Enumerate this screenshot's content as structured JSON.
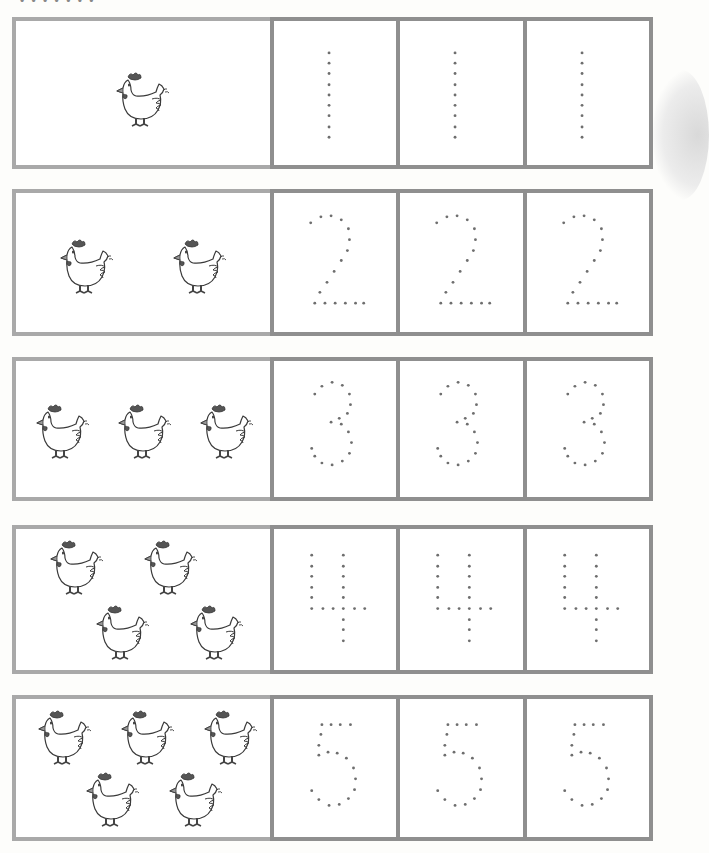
{
  "page": {
    "header_fragment": "• • • • • • •",
    "colors": {
      "pic_border": "#a9a9a9",
      "digit_border": "#8f8f8f",
      "dot": "#6e6e6e",
      "ink": "#3a3a3a",
      "comb": "#555555"
    }
  },
  "rows": [
    {
      "number": 1,
      "label": "one chicken",
      "top": 17,
      "height": 152,
      "chickens": [
        {
          "x": 98,
          "y": 50
        }
      ],
      "digit": "1"
    },
    {
      "number": 2,
      "label": "two chickens",
      "top": 189,
      "height": 147,
      "chickens": [
        {
          "x": 42,
          "y": 45
        },
        {
          "x": 155,
          "y": 45
        }
      ],
      "digit": "2"
    },
    {
      "number": 3,
      "label": "three chickens",
      "top": 357,
      "height": 144,
      "chickens": [
        {
          "x": 18,
          "y": 42
        },
        {
          "x": 100,
          "y": 42
        },
        {
          "x": 182,
          "y": 42
        }
      ],
      "digit": "3"
    },
    {
      "number": 4,
      "label": "four chickens",
      "top": 525,
      "height": 149,
      "chickens": [
        {
          "x": 32,
          "y": 10
        },
        {
          "x": 126,
          "y": 10
        },
        {
          "x": 78,
          "y": 75
        },
        {
          "x": 172,
          "y": 75
        }
      ],
      "digit": "4"
    },
    {
      "number": 5,
      "label": "five chickens",
      "top": 695,
      "height": 146,
      "chickens": [
        {
          "x": 20,
          "y": 10
        },
        {
          "x": 103,
          "y": 10
        },
        {
          "x": 186,
          "y": 10
        },
        {
          "x": 68,
          "y": 72
        },
        {
          "x": 151,
          "y": 72
        }
      ],
      "digit": "5"
    }
  ],
  "digit_dots": {
    "1": [
      [
        54,
        31
      ],
      [
        54,
        41
      ],
      [
        54,
        51
      ],
      [
        54,
        62
      ],
      [
        54,
        72
      ],
      [
        54,
        82
      ],
      [
        54,
        92
      ],
      [
        54,
        103
      ],
      [
        54,
        113
      ]
    ],
    "2": [
      [
        36,
        30
      ],
      [
        46,
        24
      ],
      [
        56,
        23
      ],
      [
        66,
        27
      ],
      [
        73,
        36
      ],
      [
        74,
        47
      ],
      [
        72,
        58
      ],
      [
        66,
        68
      ],
      [
        59,
        79
      ],
      [
        52,
        90
      ],
      [
        45,
        100
      ],
      [
        40,
        111
      ],
      [
        50,
        111
      ],
      [
        60,
        111
      ],
      [
        70,
        111
      ],
      [
        80,
        111
      ],
      [
        88,
        111
      ]
    ],
    "3": [
      [
        40,
        34
      ],
      [
        47,
        26
      ],
      [
        57,
        22
      ],
      [
        67,
        25
      ],
      [
        74,
        34
      ],
      [
        75,
        45
      ],
      [
        72,
        54
      ],
      [
        64,
        59
      ],
      [
        56,
        63
      ],
      [
        66,
        65
      ],
      [
        73,
        73
      ],
      [
        76,
        84
      ],
      [
        74,
        95
      ],
      [
        67,
        103
      ],
      [
        57,
        107
      ],
      [
        47,
        105
      ],
      [
        40,
        98
      ],
      [
        37,
        90
      ]
    ],
    "4": [
      [
        37,
        26
      ],
      [
        37,
        37
      ],
      [
        37,
        47
      ],
      [
        37,
        58
      ],
      [
        37,
        68
      ],
      [
        37,
        79
      ],
      [
        48,
        79
      ],
      [
        58,
        79
      ],
      [
        68,
        79
      ],
      [
        79,
        79
      ],
      [
        89,
        79
      ],
      [
        68,
        26
      ],
      [
        68,
        37
      ],
      [
        68,
        47
      ],
      [
        68,
        58
      ],
      [
        68,
        68
      ],
      [
        68,
        90
      ],
      [
        68,
        100
      ],
      [
        68,
        111
      ]
    ],
    "5": [
      [
        47,
        26
      ],
      [
        56,
        26
      ],
      [
        65,
        26
      ],
      [
        75,
        26
      ],
      [
        46,
        36
      ],
      [
        44,
        47
      ],
      [
        44,
        57
      ],
      [
        53,
        54
      ],
      [
        62,
        55
      ],
      [
        71,
        60
      ],
      [
        78,
        70
      ],
      [
        80,
        81
      ],
      [
        79,
        92
      ],
      [
        73,
        101
      ],
      [
        64,
        107
      ],
      [
        54,
        108
      ],
      [
        44,
        102
      ],
      [
        37,
        93
      ]
    ]
  }
}
